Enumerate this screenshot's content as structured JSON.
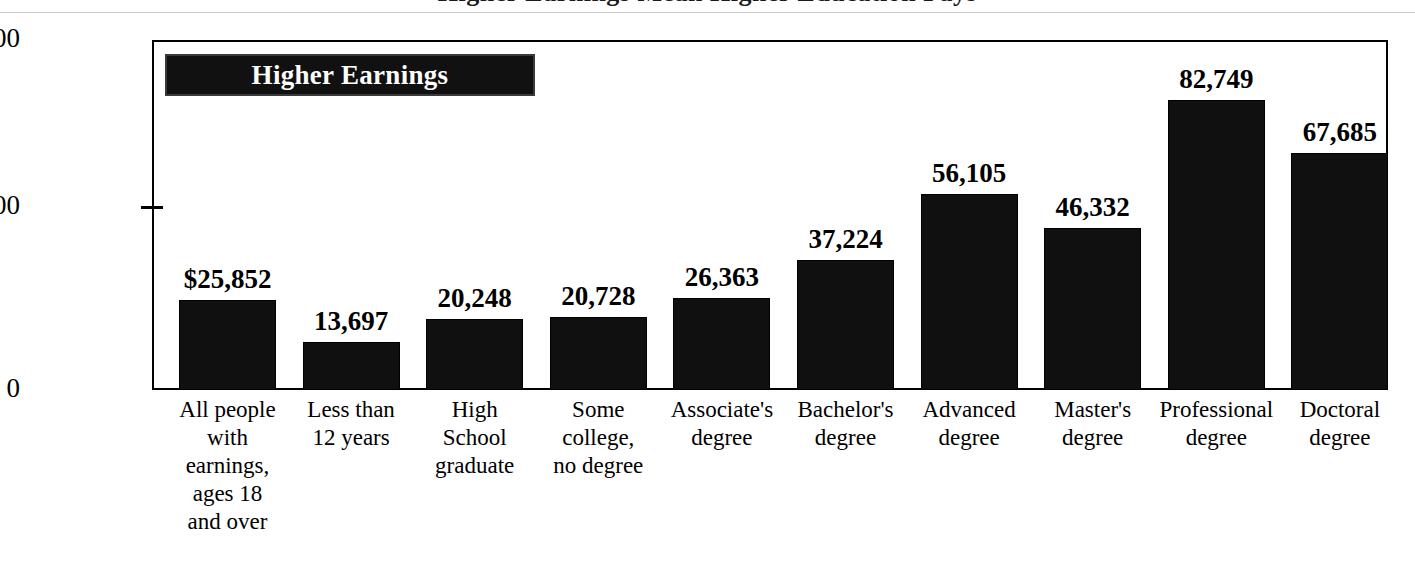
{
  "title_sliver": "Higher Earnings Mean Higher Education Pays",
  "legend": {
    "label": "Higher Earnings"
  },
  "axis": {
    "y_ticks": [
      {
        "label": "0"
      },
      {
        "label": "50,000"
      },
      {
        "label": "$100,000"
      }
    ]
  },
  "chart_data": {
    "type": "bar",
    "title": "Higher Earnings",
    "xlabel": "",
    "ylabel": "",
    "ylim": [
      0,
      100000
    ],
    "yticks": [
      0,
      50000,
      100000
    ],
    "ytick_labels": [
      "0",
      "50,000",
      "$100,000"
    ],
    "grid": false,
    "legend_position": "top-left-inside",
    "bar_color": "#101010",
    "categories": [
      "All people with earnings, ages 18 and over",
      "Less than 12 years",
      "High School graduate",
      "Some college, no degree",
      "Associate's degree",
      "Bachelor's degree",
      "Advanced degree",
      "Master's degree",
      "Professional degree",
      "Doctoral degree"
    ],
    "category_lines": [
      [
        "All people",
        "with",
        "earnings,",
        "ages 18",
        "and over"
      ],
      [
        "Less than",
        "12 years"
      ],
      [
        "High",
        "School",
        "graduate"
      ],
      [
        "Some",
        "college,",
        "no degree"
      ],
      [
        "Associate's",
        "degree"
      ],
      [
        "Bachelor's",
        "degree"
      ],
      [
        "Advanced",
        "degree"
      ],
      [
        "Master's",
        "degree"
      ],
      [
        "Professional",
        "degree"
      ],
      [
        "Doctoral",
        "degree"
      ]
    ],
    "values": [
      25852,
      13697,
      20248,
      20728,
      26363,
      37224,
      56105,
      46332,
      82749,
      67685
    ],
    "value_labels": [
      "$25,852",
      "13,697",
      "20,248",
      "20,728",
      "26,363",
      "37,224",
      "56,105",
      "46,332",
      "82,749",
      "67,685"
    ]
  }
}
